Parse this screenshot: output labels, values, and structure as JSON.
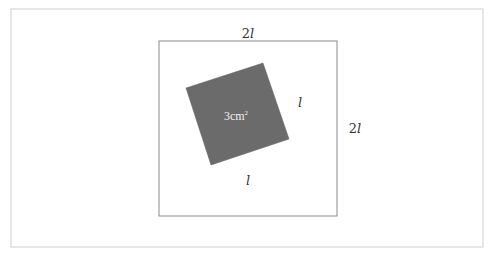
{
  "diagram": {
    "frame": {
      "x": 11,
      "y": 9,
      "width": 472,
      "height": 238,
      "stroke": "#cfcfcf"
    },
    "outer_square": {
      "x": 159,
      "y": 41,
      "width": 178,
      "height": 175,
      "stroke": "#8a8a8a",
      "top_label": "2l",
      "right_label": "2l"
    },
    "inner_square": {
      "points": "263,63 289,139 211,165 186,88",
      "fill": "#6b6b6b",
      "area_label": "3cm",
      "area_label_sup": "2",
      "side_right_label": "l",
      "side_bottom_label": "l"
    },
    "colors": {
      "background": "#ffffff",
      "shaded": "#6b6b6b",
      "lines": "#8a8a8a"
    }
  }
}
